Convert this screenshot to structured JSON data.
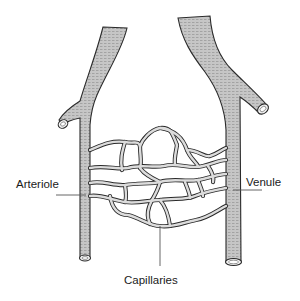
{
  "diagram": {
    "type": "anatomical-illustration",
    "labels": {
      "arteriole": "Arteriole",
      "venule": "Venule",
      "capillaries": "Capillaries"
    },
    "colors": {
      "vessel_fill": "#c4c4c4",
      "vessel_outline": "#2a2a2a",
      "vessel_shading": "#8a8a8a",
      "capillary_fill": "#d6d6d6",
      "leader_line": "#555555",
      "background": "#ffffff"
    }
  }
}
